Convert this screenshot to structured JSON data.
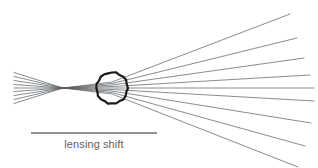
{
  "figure": {
    "type": "ray-optics-diagram",
    "width": 318,
    "height": 168,
    "background_color": "#ffffff",
    "annotation_label": "lensing shift",
    "annotation_label_color": "#5f5f5f",
    "ray_color": "#555a5e",
    "ray_width": 0.7,
    "lens_circle_color": "#1a1a1a",
    "lens_circle_width": 2.2,
    "scalebar_color": "#6b6f72",
    "scalebar_width": 1.4
  },
  "geometry": {
    "source_x": 14,
    "focus_x": 63,
    "focus_y": 88,
    "lens_center_x": 112,
    "lens_center_y": 88,
    "lens_radius": 15.5,
    "left_fan_top_y": 72,
    "left_fan_bottom_y": 106,
    "ray_count": 9,
    "scalebar_x1": 31,
    "scalebar_x2": 157,
    "scalebar_y": 133,
    "caption_center_x": 94,
    "caption_y": 148
  },
  "rays": {
    "left_start_y": [
      72.5,
      76.5,
      80.5,
      84.5,
      88.0,
      91.5,
      95.5,
      99.5,
      103.5
    ],
    "right_end_x": [
      290,
      297,
      304,
      310,
      314,
      314,
      311,
      305,
      298
    ],
    "right_end_y": [
      14,
      38,
      58,
      75,
      88,
      101,
      123,
      146,
      167
    ]
  },
  "chart_data": {
    "type": "line",
    "title": "",
    "xlabel": "",
    "ylabel": "",
    "series": [
      {
        "name": "ray-1",
        "x": [
          14,
          63,
          112,
          290
        ],
        "y": [
          72.5,
          88,
          82.0,
          14
        ]
      },
      {
        "name": "ray-2",
        "x": [
          14,
          63,
          112,
          297
        ],
        "y": [
          76.5,
          88,
          83.5,
          38
        ]
      },
      {
        "name": "ray-3",
        "x": [
          14,
          63,
          112,
          304
        ],
        "y": [
          80.5,
          88,
          85.0,
          58
        ]
      },
      {
        "name": "ray-4",
        "x": [
          14,
          63,
          112,
          310
        ],
        "y": [
          84.5,
          88,
          86.5,
          75
        ]
      },
      {
        "name": "ray-5",
        "x": [
          14,
          63,
          112,
          314
        ],
        "y": [
          88.0,
          88,
          88.0,
          88
        ]
      },
      {
        "name": "ray-6",
        "x": [
          14,
          63,
          112,
          314
        ],
        "y": [
          91.5,
          88,
          89.5,
          101
        ]
      },
      {
        "name": "ray-7",
        "x": [
          14,
          63,
          112,
          311
        ],
        "y": [
          95.5,
          88,
          91.0,
          123
        ]
      },
      {
        "name": "ray-8",
        "x": [
          14,
          63,
          112,
          305
        ],
        "y": [
          99.5,
          88,
          92.5,
          146
        ]
      },
      {
        "name": "ray-9",
        "x": [
          14,
          63,
          112,
          298
        ],
        "y": [
          103.5,
          88,
          94.0,
          167
        ]
      }
    ],
    "annotations": [
      {
        "text": "lensing shift",
        "x": 94,
        "y": 148,
        "type": "scalebar-caption"
      }
    ],
    "xlim": [
      0,
      318
    ],
    "ylim": [
      0,
      168
    ],
    "grid": false,
    "legend": "none"
  }
}
